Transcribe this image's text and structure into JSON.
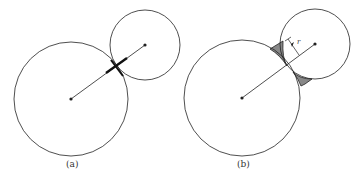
{
  "figure": {
    "panels": [
      {
        "id": "a",
        "label": "(a)",
        "large_circle": {
          "cx": 71,
          "cy": 99,
          "r": 57
        },
        "small_circle": {
          "cx": 145,
          "cy": 45,
          "r": 35
        },
        "contact": "point contact with thick neck segment along center line"
      },
      {
        "id": "b",
        "label": "(b)",
        "large_circle": {
          "cx": 242,
          "cy": 98,
          "r": 58
        },
        "small_circle": {
          "cx": 315,
          "cy": 44,
          "r": 35
        },
        "contact": "overlapping circles with shaded neck (fillet) regions",
        "radius_label": "r"
      }
    ],
    "colors": {
      "stroke": "#222222",
      "neck_fill": "#888888",
      "background": "#ffffff"
    }
  }
}
